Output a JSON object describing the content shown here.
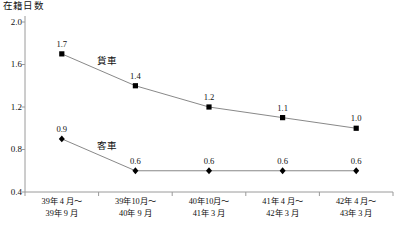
{
  "chart_data": {
    "type": "line",
    "title": "在籍日数",
    "xlabel": "",
    "ylabel": "在籍日数",
    "ylim": [
      0.4,
      2.0
    ],
    "yticks": [
      "0.4",
      "0.8",
      "1.2",
      "1.6",
      "2.0"
    ],
    "grid": false,
    "legend_position": "inline",
    "categories": [
      {
        "line1": "39年 4 月～",
        "line2": "39年 9 月"
      },
      {
        "line1": "39年10月～",
        "line2": "40年 9 月"
      },
      {
        "line1": "40年10月～",
        "line2": "41年 3 月"
      },
      {
        "line1": "41年 4 月～",
        "line2": "42年 3 月"
      },
      {
        "line1": "42年 4 月～",
        "line2": "43年 3 月"
      }
    ],
    "series": [
      {
        "name": "貨車",
        "marker": "square",
        "values": [
          1.7,
          1.4,
          1.2,
          1.1,
          1.0
        ],
        "labels": [
          "1.7",
          "1.4",
          "1.2",
          "1.1",
          "1.0"
        ]
      },
      {
        "name": "客車",
        "marker": "diamond",
        "values": [
          0.9,
          0.6,
          0.6,
          0.6,
          0.6
        ],
        "labels": [
          "0.9",
          "0.6",
          "0.6",
          "0.6",
          "0.6"
        ]
      }
    ],
    "colors": {
      "line": "#7a7a7a",
      "marker": "#000000",
      "axis": "#9a9a9a",
      "text": "#111111",
      "background": "#ffffff"
    }
  }
}
